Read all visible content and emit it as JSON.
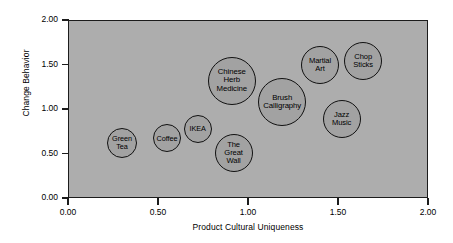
{
  "chart_data": {
    "type": "scatter",
    "title": "",
    "xlabel": "Product Cultural Uniqueness",
    "ylabel": "Change Behavior",
    "xlim": [
      0.0,
      2.0
    ],
    "ylim": [
      0.0,
      2.0
    ],
    "xticks": [
      "0.00",
      "0.50",
      "1.00",
      "1.50",
      "2.00"
    ],
    "yticks": [
      "0.00",
      "0.50",
      "1.00",
      "1.50",
      "2.00"
    ],
    "xtick_values": [
      0.0,
      0.5,
      1.0,
      1.5,
      2.0
    ],
    "ytick_values": [
      0.0,
      0.5,
      1.0,
      1.5,
      2.0
    ],
    "grid": false,
    "legend": "none",
    "plot_background": "#adadad",
    "bubble_fill": "#a2a2a2",
    "bubble_stroke": "#111111",
    "points": [
      {
        "label": "Green\nTea",
        "x": 0.3,
        "y": 0.62,
        "size": 15
      },
      {
        "label": "Coffee",
        "x": 0.55,
        "y": 0.67,
        "size": 14
      },
      {
        "label": "IKEA",
        "x": 0.72,
        "y": 0.78,
        "size": 14
      },
      {
        "label": "The\nGreat\nWall",
        "x": 0.92,
        "y": 0.51,
        "size": 19
      },
      {
        "label": "Chinese\nHerb\nMedicine",
        "x": 0.91,
        "y": 1.32,
        "size": 24
      },
      {
        "label": "Brush\nCalligraphy",
        "x": 1.19,
        "y": 1.08,
        "size": 24
      },
      {
        "label": "Martial\nArt",
        "x": 1.4,
        "y": 1.49,
        "size": 19
      },
      {
        "label": "Chop\nSticks",
        "x": 1.64,
        "y": 1.54,
        "size": 19
      },
      {
        "label": "Jazz\nMusic",
        "x": 1.52,
        "y": 0.89,
        "size": 19
      }
    ]
  }
}
